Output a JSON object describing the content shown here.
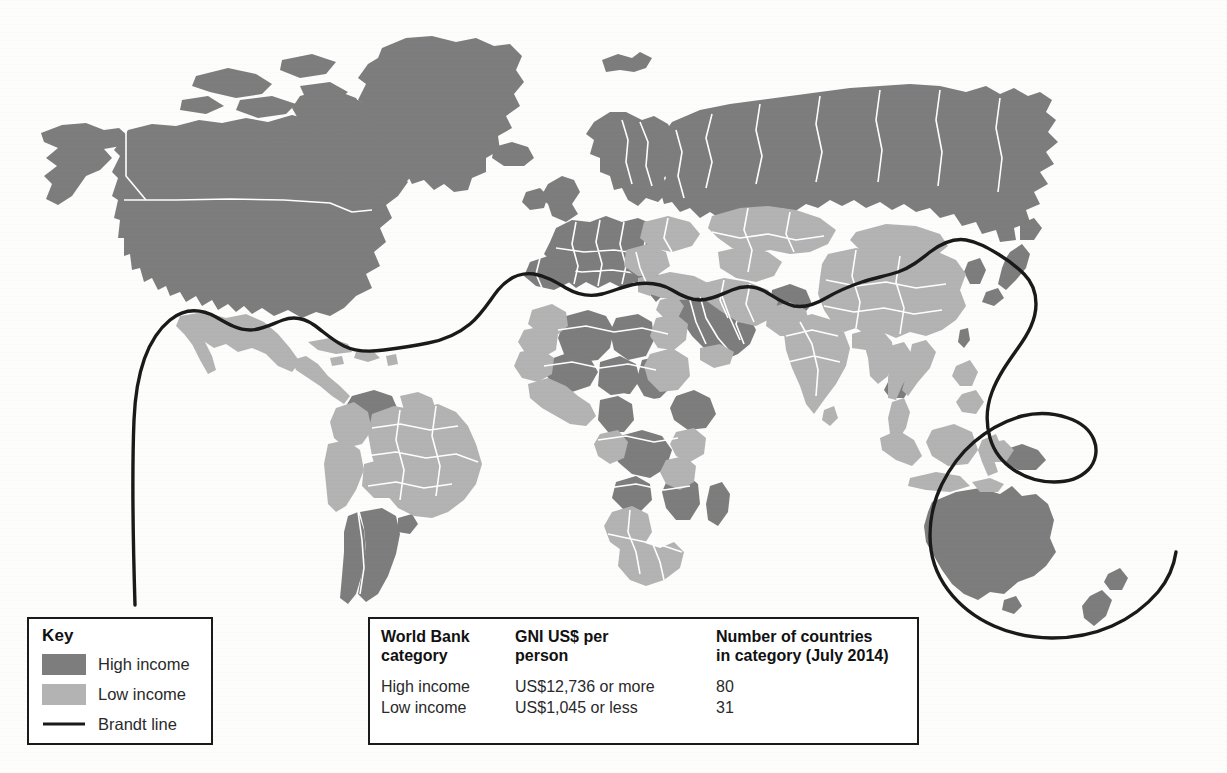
{
  "figure": {
    "background_color": "#fdfdfc"
  },
  "colors": {
    "high_income": "#7d7d7d",
    "low_income": "#b3b3b3",
    "brandt_line": "#1a1a1a",
    "country_border": "#ffffff",
    "box_border": "#1a1a1a",
    "box_fill": "#ffffff"
  },
  "key": {
    "title": "Key",
    "items": [
      {
        "label": "High income",
        "swatch": "high-income-swatch",
        "color": "#7d7d7d"
      },
      {
        "label": "Low income",
        "swatch": "low-income-swatch",
        "color": "#b3b3b3"
      },
      {
        "label": "Brandt line",
        "swatch": "brandt-line-swatch",
        "color": "#1a1a1a"
      }
    ]
  },
  "table": {
    "headers": [
      "World Bank category",
      "GNI US$ per person",
      "Number of countries in category (July 2014)"
    ],
    "headers_line1": [
      "World Bank",
      "GNI US$ per",
      "Number of countries"
    ],
    "headers_line2": [
      "category",
      "person",
      "in category (July 2014)"
    ],
    "rows": [
      {
        "category": "High income",
        "gni": "US$12,736 or more",
        "count": "80"
      },
      {
        "category": "Low income",
        "gni": "US$1,045 or less",
        "count": "31"
      }
    ]
  },
  "map_regions": {
    "high_income": [
      "Canada",
      "United States",
      "Greenland",
      "Iceland",
      "Svalbard",
      "Norway",
      "Sweden",
      "Finland",
      "United Kingdom",
      "Ireland",
      "France",
      "Spain",
      "Portugal",
      "Germany",
      "Italy",
      "Poland",
      "Austria",
      "Switzerland",
      "Czech Republic",
      "Slovakia",
      "Hungary",
      "Russia",
      "Estonia",
      "Latvia",
      "Lithuania",
      "Belarus",
      "Saudi Arabia",
      "Oman",
      "United Arab Emirates",
      "Kuwait",
      "Qatar",
      "Japan",
      "South Korea",
      "Taiwan",
      "Australia",
      "New Zealand",
      "Chile",
      "Argentina",
      "Uruguay",
      "Venezuela",
      "Algeria",
      "Libya",
      "Niger",
      "Chad",
      "Mali",
      "Angola",
      "Zimbabwe",
      "Democratic Republic of the Congo",
      "Ethiopia",
      "Mozambique",
      "Madagascar",
      "Afghanistan",
      "Cambodia",
      "Laos"
    ],
    "low_income": [
      "Mexico",
      "Central America",
      "Cuba",
      "Caribbean",
      "Brazil",
      "Colombia",
      "Peru",
      "Bolivia",
      "Paraguay",
      "Ecuador",
      "Guyana",
      "Suriname",
      "Morocco",
      "Mauritania",
      "Egypt",
      "Sudan",
      "Nigeria",
      "Kenya",
      "Tanzania",
      "South Africa",
      "Namibia",
      "Botswana",
      "Turkey",
      "Iran",
      "Iraq",
      "Syria",
      "Yemen",
      "Kazakhstan",
      "Uzbekistan",
      "Turkmenistan",
      "Kyrgyzstan",
      "Mongolia",
      "China",
      "India",
      "Pakistan",
      "Bangladesh",
      "Myanmar",
      "Thailand",
      "Vietnam",
      "Malaysia",
      "Indonesia",
      "Philippines",
      "Papua New Guinea",
      "Ukraine",
      "Romania",
      "Bulgaria",
      "Greece",
      "Serbia",
      "Croatia",
      "Bosnia"
    ]
  },
  "brandt_line": {
    "name": "Brandt line",
    "description": "Divides the wealthier global North from the poorer global South, looping south to include Australia and New Zealand."
  }
}
